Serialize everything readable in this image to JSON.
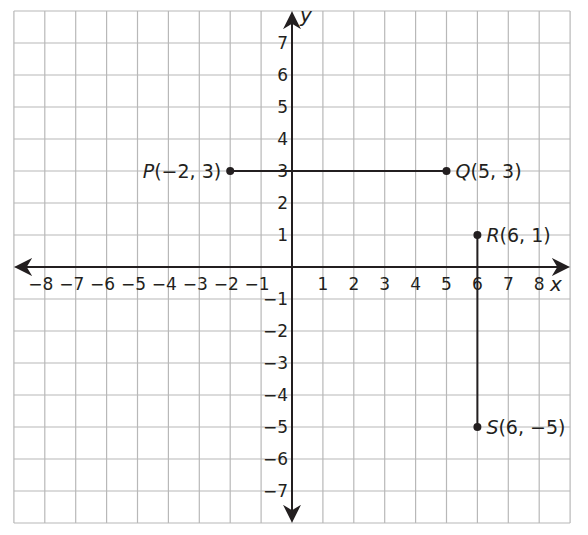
{
  "chart_data": {
    "type": "scatter",
    "title": "",
    "xlabel": "x",
    "ylabel": "y",
    "xlim": [
      -9,
      9
    ],
    "ylim": [
      -8,
      8
    ],
    "grid": true,
    "x_ticks": [
      -8,
      -7,
      -6,
      -5,
      -4,
      -3,
      -2,
      -1,
      1,
      2,
      3,
      4,
      5,
      6,
      7,
      8
    ],
    "y_ticks": [
      -7,
      -6,
      -5,
      -4,
      -3,
      -2,
      -1,
      1,
      2,
      3,
      4,
      5,
      6,
      7
    ],
    "x_tick_labels": [
      "−8",
      "−7",
      "−6",
      "−5",
      "−4",
      "−3",
      "−2",
      "−1",
      "1",
      "2",
      "3",
      "4",
      "5",
      "6",
      "7",
      "8"
    ],
    "y_tick_labels": [
      "−7",
      "−6",
      "−5",
      "−4",
      "−3",
      "−2",
      "−1",
      "1",
      "2",
      "3",
      "4",
      "5",
      "6",
      "7"
    ],
    "points": [
      {
        "name": "P",
        "x": -2,
        "y": 3,
        "label": "(−2, 3)",
        "label_side": "left"
      },
      {
        "name": "Q",
        "x": 5,
        "y": 3,
        "label": "(5, 3)",
        "label_side": "right"
      },
      {
        "name": "R",
        "x": 6,
        "y": 1,
        "label": "(6, 1)",
        "label_side": "right"
      },
      {
        "name": "S",
        "x": 6,
        "y": -5,
        "label": "(6, −5)",
        "label_side": "right"
      }
    ],
    "segments": [
      {
        "from": "P",
        "to": "Q"
      },
      {
        "from": "R",
        "to": "S"
      }
    ]
  },
  "colors": {
    "grid": "#b8b8b8",
    "axis": "#231f20",
    "ink": "#231f20",
    "background": "#ffffff"
  }
}
